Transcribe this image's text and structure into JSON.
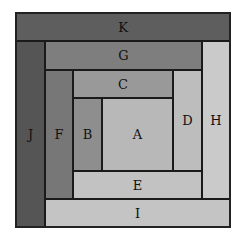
{
  "diagram": {
    "title": "",
    "type": "nested log-cabin rectangles",
    "blocks": [
      {
        "id": "K",
        "label": "K",
        "x": 16,
        "y": 13,
        "w": 214,
        "h": 28,
        "color": "#5e5e5e"
      },
      {
        "id": "J",
        "label": "J",
        "x": 16,
        "y": 41,
        "w": 29,
        "h": 186,
        "color": "#555555"
      },
      {
        "id": "I",
        "label": "I",
        "x": 45,
        "y": 199,
        "w": 185,
        "h": 28,
        "color": "#c4c4c4"
      },
      {
        "id": "H",
        "label": "H",
        "x": 202,
        "y": 41,
        "w": 28,
        "h": 158,
        "color": "#cacaca"
      },
      {
        "id": "G",
        "label": "G",
        "x": 45,
        "y": 41,
        "w": 157,
        "h": 29,
        "color": "#7e7e7e"
      },
      {
        "id": "F",
        "label": "F",
        "x": 45,
        "y": 70,
        "w": 28,
        "h": 129,
        "color": "#777777"
      },
      {
        "id": "E",
        "label": "E",
        "x": 73,
        "y": 171,
        "w": 129,
        "h": 28,
        "color": "#c2c2c2"
      },
      {
        "id": "D",
        "label": "D",
        "x": 173,
        "y": 70,
        "w": 29,
        "h": 101,
        "color": "#bdbdbd"
      },
      {
        "id": "C",
        "label": "C",
        "x": 73,
        "y": 70,
        "w": 100,
        "h": 28,
        "color": "#999999"
      },
      {
        "id": "B",
        "label": "B",
        "x": 73,
        "y": 98,
        "w": 29,
        "h": 73,
        "color": "#8e8e8e"
      },
      {
        "id": "A",
        "label": "A",
        "x": 102,
        "y": 98,
        "w": 71,
        "h": 73,
        "color": "#b8b8b8"
      }
    ]
  }
}
